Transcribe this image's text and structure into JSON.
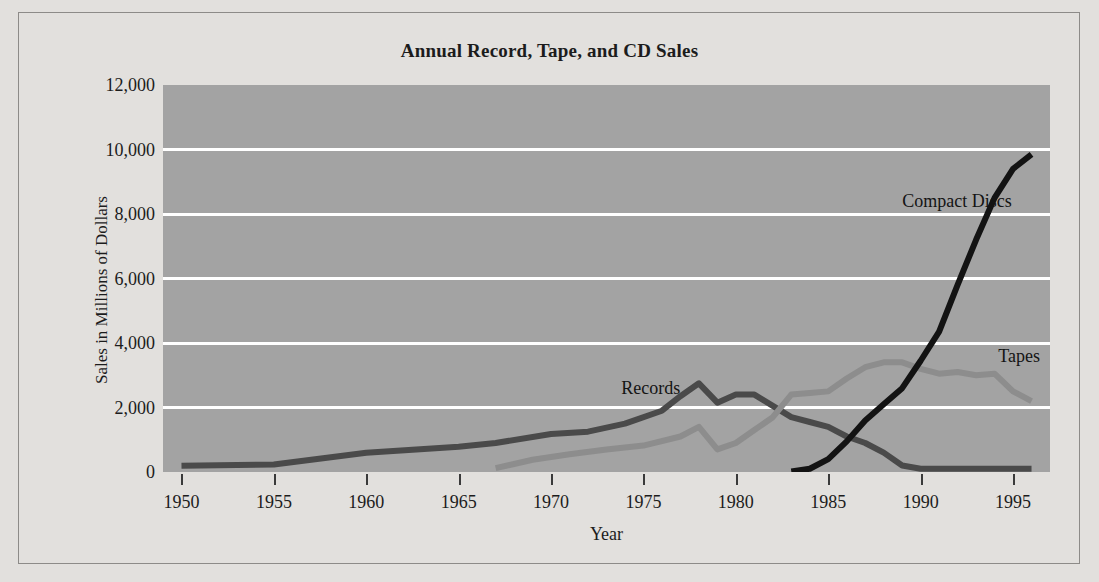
{
  "chart_data": {
    "type": "line",
    "title": "Annual Record, Tape, and CD Sales",
    "xlabel": "Year",
    "ylabel": "Sales in Millions of Dollars",
    "xlim": [
      1949,
      1997
    ],
    "ylim": [
      0,
      12000
    ],
    "grid": true,
    "legend_position": "inline-labels",
    "x_tick_labels": [
      "1950",
      "1955",
      "1960",
      "1965",
      "1970",
      "1975",
      "1980",
      "1985",
      "1990",
      "1995"
    ],
    "x_ticks": [
      1950,
      1955,
      1960,
      1965,
      1970,
      1975,
      1980,
      1985,
      1990,
      1995
    ],
    "y_tick_labels": [
      "0",
      "2,000",
      "4,000",
      "6,000",
      "8,000",
      "10,000",
      "12,000"
    ],
    "y_ticks": [
      0,
      2000,
      4000,
      6000,
      8000,
      10000,
      12000
    ],
    "plot_background": "#a3a3a3",
    "gridline_color": "#ffffff",
    "series": [
      {
        "name": "Records",
        "label": "Records",
        "color": "#4a4a4a",
        "x": [
          1950,
          1955,
          1960,
          1965,
          1967,
          1970,
          1972,
          1974,
          1976,
          1977,
          1978,
          1979,
          1980,
          1981,
          1982,
          1983,
          1984,
          1985,
          1986,
          1987,
          1988,
          1989,
          1990,
          1991,
          1992,
          1993,
          1994,
          1995,
          1996
        ],
        "y": [
          190,
          230,
          600,
          780,
          900,
          1180,
          1250,
          1500,
          1900,
          2350,
          2750,
          2150,
          2400,
          2400,
          2050,
          1700,
          1550,
          1400,
          1100,
          900,
          600,
          200,
          100,
          100,
          100,
          100,
          100,
          100,
          100
        ]
      },
      {
        "name": "Tapes",
        "label": "Tapes",
        "color": "#8d8d8d",
        "x": [
          1967,
          1969,
          1971,
          1973,
          1975,
          1977,
          1978,
          1979,
          1980,
          1981,
          1982,
          1983,
          1984,
          1985,
          1986,
          1987,
          1988,
          1989,
          1990,
          1991,
          1992,
          1993,
          1994,
          1995,
          1996
        ],
        "y": [
          120,
          380,
          550,
          700,
          820,
          1100,
          1400,
          700,
          900,
          1300,
          1700,
          2400,
          2450,
          2500,
          2900,
          3250,
          3400,
          3400,
          3200,
          3050,
          3100,
          3000,
          3050,
          2500,
          2200
        ]
      },
      {
        "name": "Compact Discs",
        "label": "Compact Discs",
        "color": "#131313",
        "x": [
          1983,
          1984,
          1985,
          1986,
          1987,
          1988,
          1989,
          1990,
          1991,
          1992,
          1993,
          1994,
          1995,
          1996
        ],
        "y": [
          20,
          100,
          400,
          950,
          1600,
          2100,
          2600,
          3450,
          4350,
          5800,
          7200,
          8500,
          9400,
          9850
        ]
      }
    ],
    "annotations": [
      {
        "text": "Compact Discs",
        "x": 1989,
        "y": 8700
      },
      {
        "text": "Tapes",
        "x": 1994.2,
        "y": 3900
      },
      {
        "text": "Records",
        "x": 1973.8,
        "y": 2900
      }
    ]
  }
}
